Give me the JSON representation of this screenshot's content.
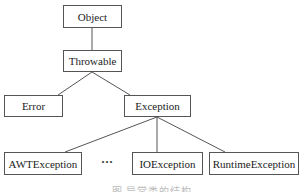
{
  "diagram": {
    "nodes": {
      "object": "Object",
      "throwable": "Throwable",
      "error": "Error",
      "exception": "Exception",
      "awt": "AWTException",
      "ellipsis": "···",
      "io": "IOException",
      "runtime": "RuntimeException"
    },
    "edges": [
      [
        "Object",
        "Throwable"
      ],
      [
        "Throwable",
        "Error"
      ],
      [
        "Throwable",
        "Exception"
      ],
      [
        "Exception",
        "AWTException"
      ],
      [
        "Exception",
        "IOException"
      ],
      [
        "Exception",
        "RuntimeException"
      ]
    ],
    "caption": "图 异常类的结构"
  }
}
